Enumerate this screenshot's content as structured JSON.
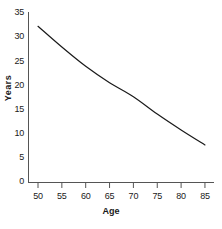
{
  "chart_data": {
    "type": "line",
    "title": "",
    "xlabel": "Age",
    "ylabel": "Years",
    "xlim": [
      47,
      88
    ],
    "ylim": [
      0,
      35
    ],
    "xticks": [
      50,
      55,
      60,
      65,
      70,
      75,
      80,
      85
    ],
    "xtick_labels": [
      "50",
      "55",
      "60",
      "65",
      "70",
      "75",
      "80",
      "85"
    ],
    "yticks": [
      0,
      5,
      10,
      15,
      20,
      25,
      30,
      35
    ],
    "ytick_labels": [
      "0",
      "5",
      "10",
      "15",
      "20",
      "25",
      "30",
      "35"
    ],
    "grid": false,
    "legend": false,
    "series": [
      {
        "name": "Remaining life expectancy",
        "color": "#1a1a1a",
        "x": [
          50,
          55,
          60,
          65,
          70,
          75,
          80,
          85
        ],
        "values": [
          32.3,
          28.0,
          24.0,
          20.6,
          17.7,
          14.1,
          10.8,
          7.7
        ]
      }
    ]
  },
  "axis": {
    "x_title": "Age",
    "y_title": "Years"
  },
  "style": {
    "line_color": "#1a1a1a",
    "axis_color": "#555555",
    "background": "#ffffff"
  }
}
